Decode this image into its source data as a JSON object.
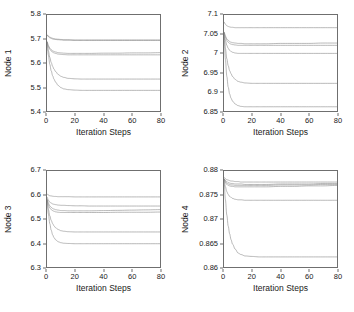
{
  "figure": {
    "layout": "2x2 grid of line charts",
    "panel_order": [
      "node1",
      "node2",
      "node3",
      "node4"
    ]
  },
  "chart_data": [
    {
      "id": "node1",
      "type": "line",
      "title": "",
      "xlabel": "Iteration Steps",
      "ylabel": "Node 1",
      "xlim": [
        0,
        80
      ],
      "ylim": [
        5.4,
        5.8
      ],
      "xticks": [
        0,
        20,
        40,
        60,
        80
      ],
      "xtick_labels": [
        "0",
        "20",
        "40",
        "60",
        "80"
      ],
      "yticks": [
        5.4,
        5.5,
        5.6,
        5.7,
        5.8
      ],
      "ytick_labels": [
        "5.4",
        "5.5",
        "5.6",
        "5.7",
        "5.8"
      ],
      "grid": false,
      "legend": "none",
      "x": [
        0,
        1,
        2,
        3,
        4,
        5,
        6,
        8,
        10,
        12,
        15,
        20,
        25,
        30,
        40,
        50,
        60,
        70,
        80
      ],
      "series": [
        {
          "name": "agent-1",
          "values": [
            5.715,
            5.712,
            5.708,
            5.705,
            5.703,
            5.701,
            5.7,
            5.699,
            5.698,
            5.697,
            5.697,
            5.696,
            5.696,
            5.696,
            5.696,
            5.696,
            5.696,
            5.696,
            5.696
          ]
        },
        {
          "name": "agent-2",
          "values": [
            5.718,
            5.71,
            5.705,
            5.702,
            5.7,
            5.699,
            5.698,
            5.697,
            5.696,
            5.695,
            5.695,
            5.694,
            5.694,
            5.694,
            5.694,
            5.694,
            5.694,
            5.694,
            5.694
          ]
        },
        {
          "name": "agent-3",
          "values": [
            5.69,
            5.672,
            5.662,
            5.655,
            5.651,
            5.648,
            5.646,
            5.643,
            5.642,
            5.641,
            5.64,
            5.64,
            5.64,
            5.64,
            5.641,
            5.641,
            5.642,
            5.642,
            5.643
          ]
        },
        {
          "name": "agent-4",
          "values": [
            5.688,
            5.668,
            5.657,
            5.65,
            5.645,
            5.642,
            5.64,
            5.637,
            5.636,
            5.635,
            5.634,
            5.634,
            5.634,
            5.634,
            5.634,
            5.634,
            5.634,
            5.634,
            5.634
          ]
        },
        {
          "name": "agent-5",
          "values": [
            5.688,
            5.65,
            5.623,
            5.602,
            5.586,
            5.574,
            5.565,
            5.552,
            5.544,
            5.54,
            5.536,
            5.534,
            5.533,
            5.533,
            5.533,
            5.533,
            5.533,
            5.533,
            5.533
          ]
        },
        {
          "name": "agent-6",
          "values": [
            5.688,
            5.632,
            5.594,
            5.567,
            5.547,
            5.532,
            5.521,
            5.506,
            5.497,
            5.492,
            5.489,
            5.487,
            5.486,
            5.486,
            5.486,
            5.486,
            5.486,
            5.486,
            5.486
          ]
        }
      ]
    },
    {
      "id": "node2",
      "type": "line",
      "title": "",
      "xlabel": "Iteration Steps",
      "ylabel": "Node 2",
      "xlim": [
        0,
        80
      ],
      "ylim": [
        6.85,
        7.1
      ],
      "xticks": [
        0,
        20,
        40,
        60,
        80
      ],
      "xtick_labels": [
        "0",
        "20",
        "40",
        "60",
        "80"
      ],
      "yticks": [
        6.85,
        6.9,
        6.95,
        7,
        7.05,
        7.1
      ],
      "ytick_labels": [
        "6.85",
        "6.9",
        "6.95",
        "7",
        "7.05",
        "7.1"
      ],
      "grid": false,
      "legend": "none",
      "x": [
        0,
        1,
        2,
        3,
        4,
        5,
        6,
        8,
        10,
        12,
        15,
        20,
        25,
        30,
        40,
        50,
        60,
        70,
        80
      ],
      "series": [
        {
          "name": "agent-1",
          "values": [
            7.082,
            7.076,
            7.072,
            7.07,
            7.069,
            7.068,
            7.068,
            7.067,
            7.067,
            7.067,
            7.067,
            7.067,
            7.067,
            7.067,
            7.067,
            7.067,
            7.067,
            7.067,
            7.067
          ]
        },
        {
          "name": "agent-2",
          "values": [
            7.056,
            7.045,
            7.038,
            7.034,
            7.031,
            7.029,
            7.028,
            7.027,
            7.026,
            7.026,
            7.025,
            7.025,
            7.025,
            7.025,
            7.026,
            7.026,
            7.026,
            7.027,
            7.027
          ]
        },
        {
          "name": "agent-3",
          "values": [
            7.056,
            7.042,
            7.034,
            7.029,
            7.026,
            7.024,
            7.023,
            7.022,
            7.021,
            7.021,
            7.021,
            7.021,
            7.021,
            7.021,
            7.021,
            7.021,
            7.021,
            7.021,
            7.021
          ]
        },
        {
          "name": "agent-4",
          "values": [
            7.054,
            7.034,
            7.021,
            7.013,
            7.008,
            7.005,
            7.003,
            7.001,
            7.0,
            7.0,
            7.0,
            7.0,
            7.0,
            7.0,
            7.0,
            7.0,
            7.0,
            7.0,
            7.0
          ]
        },
        {
          "name": "agent-5",
          "values": [
            7.054,
            7.013,
            6.986,
            6.968,
            6.955,
            6.947,
            6.94,
            6.932,
            6.927,
            6.925,
            6.923,
            6.922,
            6.922,
            6.922,
            6.922,
            6.922,
            6.922,
            6.922,
            6.922
          ]
        },
        {
          "name": "agent-6",
          "values": [
            7.052,
            6.984,
            6.94,
            6.912,
            6.894,
            6.883,
            6.876,
            6.868,
            6.864,
            6.862,
            6.861,
            6.861,
            6.861,
            6.861,
            6.861,
            6.861,
            6.861,
            6.861,
            6.861
          ]
        }
      ]
    },
    {
      "id": "node3",
      "type": "line",
      "title": "",
      "xlabel": "Iteration Steps",
      "ylabel": "Node 3",
      "xlim": [
        0,
        80
      ],
      "ylim": [
        6.3,
        6.7
      ],
      "xticks": [
        0,
        20,
        40,
        60,
        80
      ],
      "xtick_labels": [
        "0",
        "20",
        "40",
        "60",
        "80"
      ],
      "yticks": [
        6.3,
        6.4,
        6.5,
        6.6,
        6.7
      ],
      "ytick_labels": [
        "6.3",
        "6.4",
        "6.5",
        "6.6",
        "6.7"
      ],
      "grid": false,
      "legend": "none",
      "x": [
        0,
        1,
        2,
        3,
        4,
        5,
        6,
        8,
        10,
        12,
        15,
        20,
        25,
        30,
        40,
        50,
        60,
        70,
        80
      ],
      "series": [
        {
          "name": "agent-1",
          "values": [
            6.604,
            6.6,
            6.597,
            6.596,
            6.595,
            6.594,
            6.594,
            6.593,
            6.593,
            6.593,
            6.593,
            6.592,
            6.592,
            6.592,
            6.592,
            6.592,
            6.592,
            6.592,
            6.592
          ]
        },
        {
          "name": "agent-2",
          "values": [
            6.592,
            6.578,
            6.57,
            6.566,
            6.563,
            6.561,
            6.56,
            6.558,
            6.557,
            6.557,
            6.556,
            6.555,
            6.555,
            6.554,
            6.554,
            6.554,
            6.554,
            6.554,
            6.554
          ]
        },
        {
          "name": "agent-3",
          "values": [
            6.585,
            6.566,
            6.555,
            6.548,
            6.544,
            6.541,
            6.539,
            6.537,
            6.535,
            6.535,
            6.534,
            6.534,
            6.534,
            6.534,
            6.535,
            6.536,
            6.537,
            6.538,
            6.539
          ]
        },
        {
          "name": "agent-4",
          "values": [
            6.58,
            6.558,
            6.546,
            6.539,
            6.535,
            6.532,
            6.53,
            6.528,
            6.527,
            6.527,
            6.527,
            6.527,
            6.527,
            6.527,
            6.527,
            6.528,
            6.528,
            6.528,
            6.529
          ]
        },
        {
          "name": "agent-5",
          "values": [
            6.58,
            6.54,
            6.513,
            6.494,
            6.481,
            6.471,
            6.464,
            6.456,
            6.451,
            6.449,
            6.447,
            6.446,
            6.446,
            6.446,
            6.446,
            6.446,
            6.446,
            6.446,
            6.446
          ]
        },
        {
          "name": "agent-6",
          "values": [
            6.58,
            6.52,
            6.48,
            6.453,
            6.434,
            6.422,
            6.414,
            6.405,
            6.401,
            6.399,
            6.398,
            6.397,
            6.397,
            6.397,
            6.397,
            6.397,
            6.397,
            6.397,
            6.397
          ]
        }
      ]
    },
    {
      "id": "node4",
      "type": "line",
      "title": "",
      "xlabel": "Iteration Steps",
      "ylabel": "Node 4",
      "xlim": [
        0,
        80
      ],
      "ylim": [
        0.86,
        0.88
      ],
      "xticks": [
        0,
        20,
        40,
        60,
        80
      ],
      "xtick_labels": [
        "0",
        "20",
        "40",
        "60",
        "80"
      ],
      "yticks": [
        0.86,
        0.865,
        0.87,
        0.875,
        0.88
      ],
      "ytick_labels": [
        "0.86",
        "0.865",
        "0.87",
        "0.875",
        "0.88"
      ],
      "grid": false,
      "legend": "none",
      "x": [
        0,
        1,
        2,
        3,
        4,
        5,
        6,
        8,
        10,
        12,
        15,
        20,
        25,
        30,
        40,
        50,
        60,
        70,
        80
      ],
      "series": [
        {
          "name": "agent-1",
          "values": [
            0.8787,
            0.8784,
            0.8782,
            0.8781,
            0.878,
            0.8779,
            0.8779,
            0.8778,
            0.8778,
            0.8777,
            0.8777,
            0.8777,
            0.8777,
            0.8777,
            0.8777,
            0.8777,
            0.8777,
            0.8777,
            0.8777
          ]
        },
        {
          "name": "agent-2",
          "values": [
            0.8784,
            0.878,
            0.8778,
            0.8776,
            0.8775,
            0.8774,
            0.8774,
            0.8773,
            0.8773,
            0.8773,
            0.8772,
            0.8772,
            0.8772,
            0.8772,
            0.8773,
            0.8773,
            0.8773,
            0.8774,
            0.8774
          ]
        },
        {
          "name": "agent-3",
          "values": [
            0.8784,
            0.8778,
            0.8775,
            0.8773,
            0.8772,
            0.8771,
            0.8771,
            0.877,
            0.877,
            0.877,
            0.877,
            0.877,
            0.877,
            0.877,
            0.8771,
            0.8771,
            0.8771,
            0.8772,
            0.8772
          ]
        },
        {
          "name": "agent-4",
          "values": [
            0.8783,
            0.8776,
            0.8772,
            0.877,
            0.8769,
            0.8768,
            0.8768,
            0.8767,
            0.8767,
            0.8767,
            0.8767,
            0.8767,
            0.8767,
            0.8767,
            0.8768,
            0.8768,
            0.8769,
            0.8769,
            0.877
          ]
        },
        {
          "name": "agent-5",
          "values": [
            0.8783,
            0.8767,
            0.8757,
            0.8751,
            0.8747,
            0.8745,
            0.8743,
            0.8741,
            0.874,
            0.874,
            0.8739,
            0.8739,
            0.8739,
            0.8739,
            0.8739,
            0.8739,
            0.8739,
            0.8739,
            0.8739
          ]
        },
        {
          "name": "agent-6",
          "values": [
            0.8782,
            0.874,
            0.8708,
            0.8685,
            0.8669,
            0.8657,
            0.8648,
            0.8637,
            0.8629,
            0.8626,
            0.8623,
            0.8622,
            0.8621,
            0.8621,
            0.8621,
            0.8621,
            0.8621,
            0.8621,
            0.8621
          ]
        }
      ]
    }
  ],
  "style": {
    "line_color": "#8a8a8a",
    "frame_color": "#6f6f6f",
    "background": "#ffffff",
    "text_color": "#1a1a1a"
  }
}
